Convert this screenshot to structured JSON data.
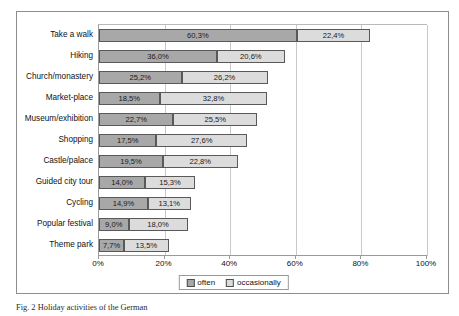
{
  "chart_data": {
    "type": "bar",
    "orientation": "horizontal",
    "stacked": true,
    "title": "",
    "xlabel": "",
    "ylabel": "",
    "xlim": [
      0,
      100
    ],
    "xticks": [
      "0%",
      "20%",
      "40%",
      "60%",
      "80%",
      "100%"
    ],
    "xtick_values": [
      0,
      20,
      40,
      60,
      80,
      100
    ],
    "grid": true,
    "legend_position": "bottom-center",
    "categories": [
      "Take a walk",
      "Hiking",
      "Church/monastery",
      "Market-place",
      "Museum/exhibition",
      "Shopping",
      "Castle/palace",
      "Guided city tour",
      "Cycling",
      "Popular festival",
      "Theme park"
    ],
    "series": [
      {
        "name": "often",
        "color": "#a8a8a8",
        "values": [
          60.3,
          36.0,
          25.2,
          18.5,
          22.7,
          17.5,
          19.5,
          14.0,
          14.9,
          9.0,
          7.7
        ],
        "labels": [
          "60,3%",
          "36,0%",
          "25,2%",
          "18,5%",
          "22,7%",
          "17,5%",
          "19,5%",
          "14,0%",
          "14,9%",
          "9,0%",
          "7,7%"
        ]
      },
      {
        "name": "occasionally",
        "color": "#dcdcdc",
        "values": [
          22.4,
          20.6,
          26.2,
          32.8,
          25.5,
          27.6,
          22.8,
          15.3,
          13.1,
          18.0,
          13.5
        ],
        "labels": [
          "22,4%",
          "20,6%",
          "26,2%",
          "32,8%",
          "25,5%",
          "27,6%",
          "22,8%",
          "15,3%",
          "13,1%",
          "18,0%",
          "13,5%"
        ]
      }
    ]
  },
  "legend": {
    "items": [
      {
        "label": "often"
      },
      {
        "label": "occasionally"
      }
    ]
  },
  "caption": {
    "text": "Fig. 2   Holiday activities of the German"
  }
}
